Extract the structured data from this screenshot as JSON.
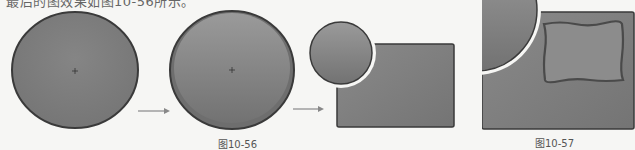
{
  "document": {
    "intro_text_partial": "最后的图效果如图10-56所示。",
    "figures": [
      {
        "id": "fig-10-56",
        "caption": "图10-56",
        "steps": [
          "circle",
          "circle-with-inner-highlight",
          "small-circle-over-rectangle-with-gap"
        ]
      },
      {
        "id": "fig-10-57",
        "caption": "图10-57",
        "description": "quarter circle over rectangle with wavy inner frame"
      }
    ],
    "arrows": [
      "arrow-right",
      "arrow-right"
    ]
  },
  "colors": {
    "shape_fill": "#7d7d7d",
    "shape_fill_light": "#8e8e8e",
    "outline": "#3a3a3a",
    "gap": "#ffffff",
    "arrow": "#888888",
    "background": "#f6f6f4"
  }
}
